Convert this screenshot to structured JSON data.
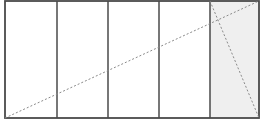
{
  "diagram": {
    "type": "rectangle-partition",
    "outer_rect": {
      "x": 5,
      "y": 1,
      "width": 254,
      "height": 117
    },
    "columns": 5,
    "divider_x": [
      57,
      108,
      159,
      210
    ],
    "shaded_column_index": 4,
    "colors": {
      "stroke": "#4a4a4a",
      "shade": "#efefef",
      "dashed": "#8a8a8a",
      "background": "#ffffff"
    },
    "dashed_lines": [
      {
        "name": "main-diagonal",
        "x1": 5,
        "y1": 118,
        "x2": 259,
        "y2": 1
      },
      {
        "name": "shaded-column-diagonal",
        "x1": 210,
        "y1": 1,
        "x2": 259,
        "y2": 118
      }
    ]
  }
}
